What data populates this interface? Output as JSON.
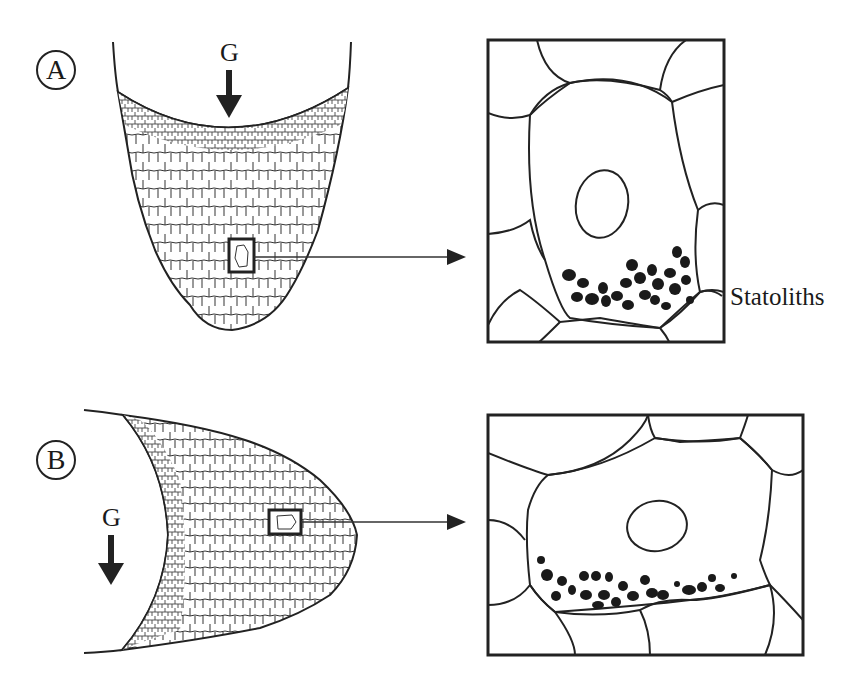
{
  "figure": {
    "panels": [
      {
        "id": "A",
        "label": "A",
        "gravity_label": "G",
        "orientation": "vertical root, tip pointing down",
        "inset_annotation": "Statoliths"
      },
      {
        "id": "B",
        "label": "B",
        "gravity_label": "G",
        "orientation": "horizontal root, tip pointing right",
        "inset_annotation": ""
      }
    ],
    "colors": {
      "line": "#222222",
      "fill_statolith": "#1a1a1a",
      "background": "#ffffff"
    }
  }
}
